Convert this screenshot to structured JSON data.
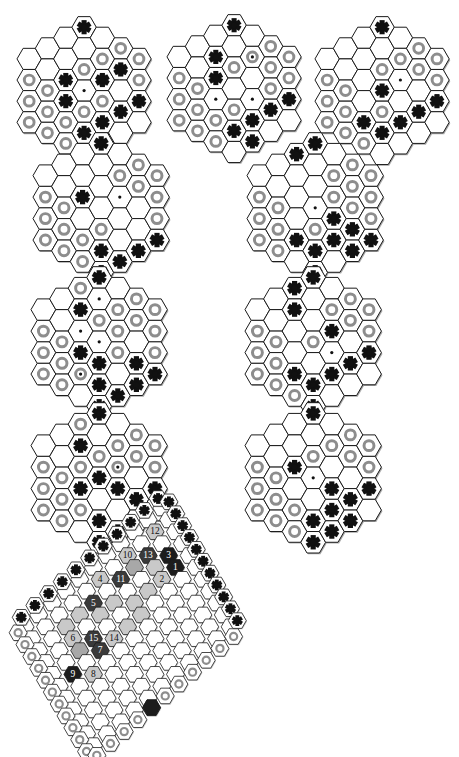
{
  "figure": {
    "background_color": "#ffffff"
  },
  "palette": {
    "board_line": "#1a1a1a",
    "hex_fill": "#ffffff",
    "hex_shadow": "#9a9a9a",
    "ring_stone": "#8d8d8d",
    "star_stone": "#111111",
    "dark_group": "#3a3a3a",
    "black_group": "#1c1c1c",
    "light_group": "#c9c9c9",
    "mid_group": "#a8a8a8",
    "label_light": "#111111",
    "label_dark": "#ffffff"
  },
  "legend": {
    "star_marker": "star-stone",
    "ring_marker": "ring-stone",
    "dot_marker": "center-dot"
  },
  "small_boards": [
    {
      "id": "board-1",
      "position": "row1-left",
      "radius": 3,
      "stars": [
        [
          -1,
          -3
        ],
        [
          -2,
          -2
        ],
        [
          -3,
          -1
        ],
        [
          0,
          -3
        ],
        [
          -1,
          0
        ],
        [
          1,
          -1
        ],
        [
          2,
          -2
        ],
        [
          -1,
          1
        ],
        [
          0,
          2
        ],
        [
          1,
          1
        ],
        [
          2,
          0
        ],
        [
          0,
          3
        ],
        [
          1,
          2
        ],
        [
          3,
          -1
        ]
      ],
      "rings": [
        [
          2,
          -3
        ],
        [
          3,
          -3
        ],
        [
          1,
          -2
        ],
        [
          2,
          -2
        ],
        [
          3,
          -2
        ],
        [
          0,
          -1
        ],
        [
          1,
          -1
        ],
        [
          3,
          -1
        ],
        [
          -3,
          1
        ],
        [
          -2,
          1
        ],
        [
          -3,
          2
        ],
        [
          -2,
          2
        ],
        [
          -1,
          2
        ],
        [
          -3,
          3
        ],
        [
          -2,
          3
        ],
        [
          -1,
          3
        ],
        [
          0,
          1
        ],
        [
          1,
          0
        ]
      ],
      "dots": [
        [
          0,
          0
        ]
      ]
    },
    {
      "id": "board-2",
      "position": "row1-middle",
      "radius": 3,
      "stars": [
        [
          -1,
          -3
        ],
        [
          -2,
          -2
        ],
        [
          -3,
          -1
        ],
        [
          0,
          -3
        ],
        [
          -1,
          -1
        ],
        [
          -1,
          0
        ],
        [
          0,
          2
        ],
        [
          1,
          1
        ],
        [
          2,
          0
        ],
        [
          3,
          -1
        ],
        [
          1,
          2
        ]
      ],
      "rings": [
        [
          2,
          -3
        ],
        [
          3,
          -3
        ],
        [
          1,
          -2
        ],
        [
          2,
          -2
        ],
        [
          3,
          -2
        ],
        [
          0,
          -1
        ],
        [
          2,
          -1
        ],
        [
          3,
          -1
        ],
        [
          -3,
          1
        ],
        [
          -2,
          1
        ],
        [
          -3,
          2
        ],
        [
          -2,
          2
        ],
        [
          -1,
          2
        ],
        [
          -3,
          3
        ],
        [
          -2,
          3
        ],
        [
          -1,
          3
        ],
        [
          0,
          1
        ]
      ],
      "dots": [
        [
          1,
          -2
        ],
        [
          1,
          0
        ],
        [
          -1,
          1
        ]
      ]
    },
    {
      "id": "board-3",
      "position": "row1-right",
      "radius": 3,
      "stars": [
        [
          -1,
          -3
        ],
        [
          -2,
          -2
        ],
        [
          -3,
          -1
        ],
        [
          0,
          -3
        ],
        [
          0,
          0
        ],
        [
          0,
          2
        ],
        [
          1,
          1
        ],
        [
          2,
          0
        ],
        [
          3,
          -1
        ],
        [
          -1,
          2
        ]
      ],
      "rings": [
        [
          2,
          -3
        ],
        [
          3,
          -3
        ],
        [
          1,
          -2
        ],
        [
          2,
          -2
        ],
        [
          3,
          -2
        ],
        [
          0,
          -1
        ],
        [
          3,
          -1
        ],
        [
          -3,
          1
        ],
        [
          -2,
          1
        ],
        [
          -3,
          2
        ],
        [
          -2,
          2
        ],
        [
          -3,
          3
        ],
        [
          -2,
          3
        ],
        [
          -1,
          3
        ],
        [
          0,
          1
        ]
      ],
      "dots": [
        [
          1,
          -1
        ]
      ]
    },
    {
      "id": "board-4",
      "position": "row2-left",
      "radius": 3,
      "stars": [
        [
          -1,
          -3
        ],
        [
          -2,
          -2
        ],
        [
          -3,
          -1
        ],
        [
          0,
          -3
        ],
        [
          -1,
          0
        ],
        [
          2,
          1
        ],
        [
          3,
          0
        ],
        [
          0,
          2
        ],
        [
          1,
          2
        ],
        [
          0,
          3
        ]
      ],
      "rings": [
        [
          2,
          -3
        ],
        [
          3,
          -3
        ],
        [
          1,
          -2
        ],
        [
          2,
          -2
        ],
        [
          3,
          -2
        ],
        [
          3,
          -1
        ],
        [
          -3,
          1
        ],
        [
          -2,
          1
        ],
        [
          -3,
          2
        ],
        [
          -2,
          2
        ],
        [
          -1,
          2
        ],
        [
          -3,
          3
        ],
        [
          -2,
          3
        ],
        [
          -1,
          3
        ],
        [
          0,
          1
        ]
      ],
      "dots": [
        [
          1,
          -1
        ]
      ]
    },
    {
      "id": "board-5",
      "position": "row2-right",
      "radius": 3,
      "stars": [
        [
          -1,
          -3
        ],
        [
          -2,
          -2
        ],
        [
          -3,
          -1
        ],
        [
          0,
          -3
        ],
        [
          -1,
          -2
        ],
        [
          1,
          0
        ],
        [
          2,
          0
        ],
        [
          0,
          2
        ],
        [
          1,
          1
        ],
        [
          2,
          1
        ],
        [
          3,
          0
        ],
        [
          0,
          3
        ],
        [
          -1,
          2
        ]
      ],
      "rings": [
        [
          2,
          -3
        ],
        [
          3,
          -3
        ],
        [
          1,
          -2
        ],
        [
          2,
          -2
        ],
        [
          3,
          -2
        ],
        [
          3,
          -1
        ],
        [
          1,
          -1
        ],
        [
          -3,
          1
        ],
        [
          -2,
          1
        ],
        [
          -3,
          2
        ],
        [
          -2,
          2
        ],
        [
          -1,
          2
        ],
        [
          -3,
          3
        ],
        [
          -2,
          3
        ],
        [
          0,
          1
        ],
        [
          2,
          -1
        ]
      ],
      "dots": [
        [
          0,
          0
        ]
      ]
    },
    {
      "id": "board-6",
      "position": "row3-left",
      "radius": 3,
      "stars": [
        [
          -1,
          -3
        ],
        [
          -2,
          -2
        ],
        [
          -3,
          -1
        ],
        [
          0,
          -3
        ],
        [
          -1,
          -1
        ],
        [
          0,
          1
        ],
        [
          -1,
          1
        ],
        [
          2,
          0
        ],
        [
          2,
          1
        ],
        [
          3,
          0
        ],
        [
          0,
          3
        ],
        [
          1,
          2
        ],
        [
          0,
          2
        ]
      ],
      "rings": [
        [
          2,
          -3
        ],
        [
          3,
          -3
        ],
        [
          1,
          -2
        ],
        [
          2,
          -2
        ],
        [
          3,
          -2
        ],
        [
          3,
          -1
        ],
        [
          -1,
          -2
        ],
        [
          0,
          -1
        ],
        [
          -3,
          1
        ],
        [
          -2,
          1
        ],
        [
          -3,
          2
        ],
        [
          -2,
          2
        ],
        [
          -1,
          2
        ],
        [
          -3,
          3
        ],
        [
          -2,
          3
        ],
        [
          1,
          0
        ],
        [
          1,
          -1
        ]
      ],
      "dots": [
        [
          0,
          -2
        ],
        [
          -1,
          2
        ],
        [
          0,
          0
        ],
        [
          -1,
          0
        ]
      ]
    },
    {
      "id": "board-7",
      "position": "row3-right",
      "radius": 3,
      "stars": [
        [
          -1,
          -3
        ],
        [
          -2,
          -2
        ],
        [
          -3,
          -1
        ],
        [
          0,
          -3
        ],
        [
          -1,
          -2
        ],
        [
          -1,
          -1
        ],
        [
          1,
          -1
        ],
        [
          -1,
          2
        ],
        [
          0,
          2
        ],
        [
          1,
          1
        ],
        [
          2,
          0
        ],
        [
          3,
          -1
        ],
        [
          0,
          3
        ]
      ],
      "rings": [
        [
          2,
          -3
        ],
        [
          3,
          -3
        ],
        [
          1,
          -2
        ],
        [
          2,
          -2
        ],
        [
          3,
          -2
        ],
        [
          3,
          -1
        ],
        [
          0,
          0
        ],
        [
          -3,
          1
        ],
        [
          -2,
          1
        ],
        [
          -3,
          2
        ],
        [
          -2,
          2
        ],
        [
          -3,
          3
        ],
        [
          -2,
          3
        ],
        [
          -1,
          3
        ]
      ],
      "dots": [
        [
          1,
          0
        ]
      ]
    },
    {
      "id": "board-8",
      "position": "row4-left",
      "radius": 3,
      "stars": [
        [
          -1,
          -3
        ],
        [
          -2,
          -2
        ],
        [
          -3,
          -1
        ],
        [
          0,
          -3
        ],
        [
          -1,
          -1
        ],
        [
          0,
          0
        ],
        [
          -1,
          1
        ],
        [
          1,
          0
        ],
        [
          2,
          0
        ],
        [
          3,
          -1
        ],
        [
          0,
          2
        ],
        [
          1,
          2
        ],
        [
          0,
          3
        ]
      ],
      "rings": [
        [
          2,
          -3
        ],
        [
          3,
          -3
        ],
        [
          1,
          -2
        ],
        [
          2,
          -2
        ],
        [
          3,
          -2
        ],
        [
          3,
          -1
        ],
        [
          0,
          -1
        ],
        [
          -1,
          -2
        ],
        [
          -1,
          0
        ],
        [
          -3,
          1
        ],
        [
          -2,
          1
        ],
        [
          -3,
          2
        ],
        [
          -2,
          2
        ],
        [
          -1,
          2
        ],
        [
          -3,
          3
        ],
        [
          -2,
          3
        ],
        [
          1,
          -1
        ]
      ],
      "dots": [
        [
          1,
          -1
        ]
      ]
    },
    {
      "id": "board-9",
      "position": "row4-right",
      "radius": 3,
      "stars": [
        [
          -1,
          -3
        ],
        [
          -2,
          -2
        ],
        [
          -3,
          -1
        ],
        [
          0,
          -3
        ],
        [
          -1,
          0
        ],
        [
          1,
          0
        ],
        [
          2,
          0
        ],
        [
          3,
          -1
        ],
        [
          0,
          2
        ],
        [
          1,
          1
        ],
        [
          2,
          1
        ],
        [
          0,
          3
        ],
        [
          1,
          2
        ]
      ],
      "rings": [
        [
          2,
          -3
        ],
        [
          3,
          -3
        ],
        [
          1,
          -2
        ],
        [
          2,
          -2
        ],
        [
          3,
          -2
        ],
        [
          3,
          -1
        ],
        [
          0,
          -1
        ],
        [
          -3,
          1
        ],
        [
          -2,
          1
        ],
        [
          -3,
          2
        ],
        [
          -2,
          2
        ],
        [
          -1,
          2
        ],
        [
          -3,
          3
        ],
        [
          -2,
          3
        ],
        [
          -1,
          3
        ]
      ],
      "dots": [
        [
          0,
          0
        ]
      ]
    }
  ],
  "large_board": {
    "id": "board-large",
    "position": "row5-center",
    "shape": "rhombus",
    "size": 11,
    "move_sequence_label": "Numbered move order 1 through 15",
    "moves": [
      {
        "n": "1",
        "col": 9,
        "row": 4,
        "group": "black"
      },
      {
        "n": "2",
        "col": 8,
        "row": 4,
        "group": "light"
      },
      {
        "n": "3",
        "col": 9,
        "row": 3,
        "group": "black"
      },
      {
        "n": "4",
        "col": 5,
        "row": 1,
        "group": "light"
      },
      {
        "n": "5",
        "col": 4,
        "row": 2,
        "group": "dark"
      },
      {
        "n": "6",
        "col": 2,
        "row": 3,
        "group": "light"
      },
      {
        "n": "7",
        "col": 3,
        "row": 5,
        "group": "dark"
      },
      {
        "n": "8",
        "col": 2,
        "row": 6,
        "group": "light"
      },
      {
        "n": "9",
        "col": 1,
        "row": 5,
        "group": "black"
      },
      {
        "n": "10",
        "col": 7,
        "row": 1,
        "group": "light"
      },
      {
        "n": "11",
        "col": 6,
        "row": 2,
        "group": "dark"
      },
      {
        "n": "12",
        "col": 9,
        "row": 1,
        "group": "light"
      },
      {
        "n": "13",
        "col": 8,
        "row": 2,
        "group": "dark"
      },
      {
        "n": "14",
        "col": 4,
        "row": 5,
        "group": "light"
      },
      {
        "n": "15",
        "col": 3,
        "row": 4,
        "group": "dark"
      }
    ],
    "edge_stars_side": "lower-right",
    "edge_rings_side": "lower-left"
  }
}
